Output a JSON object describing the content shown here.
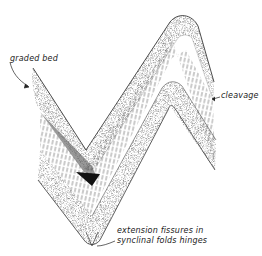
{
  "diagram": {
    "labels": {
      "graded_bed": "graded bed",
      "cleavage": "cleavage",
      "extension_line1": "extension  fissures  in",
      "extension_line2": "synclinal   folds  hinges"
    },
    "colors": {
      "ink": "#222222",
      "background": "#ffffff"
    }
  }
}
